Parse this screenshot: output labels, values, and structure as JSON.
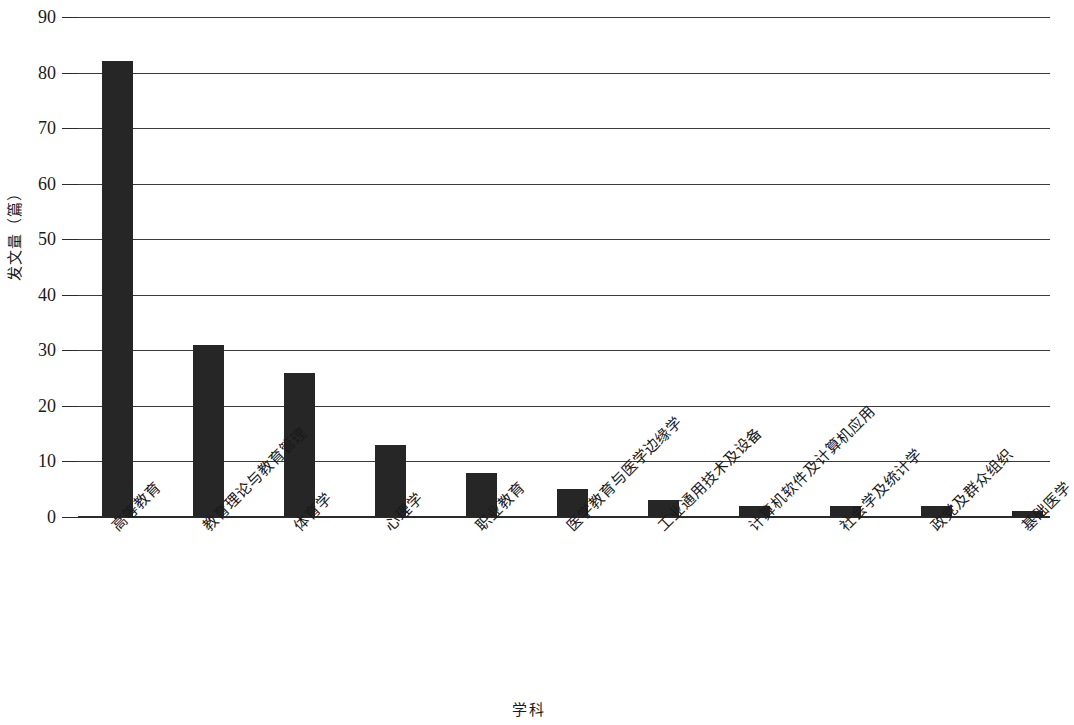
{
  "chart_data": {
    "type": "bar",
    "title": "",
    "subtitle": "",
    "xlabel": "学科",
    "ylabel": "发文量（篇）",
    "categories": [
      "高等教育",
      "教育理论与教育管理",
      "体育学",
      "心理学",
      "职业教育",
      "医学教育与医学边缘学",
      "工业通用技术及设备",
      "计算机软件及计算机应用",
      "社会学及统计学",
      "政党及群众组织",
      "基础医学"
    ],
    "values": [
      82,
      31,
      26,
      13,
      8,
      5,
      3,
      2,
      2,
      2,
      1
    ],
    "ylim": [
      0,
      90
    ],
    "ytick_labels": [
      "0",
      "10",
      "20",
      "30",
      "40",
      "50",
      "60",
      "70",
      "80",
      "90"
    ],
    "ytick_values": [
      0,
      10,
      20,
      30,
      40,
      50,
      60,
      70,
      80,
      90
    ],
    "grid": true,
    "legend": "none",
    "bar_color": "#262626",
    "axis_color": "#2b2b2b",
    "grid_color": "#3a3a3a",
    "background_color": "#ffffff"
  }
}
